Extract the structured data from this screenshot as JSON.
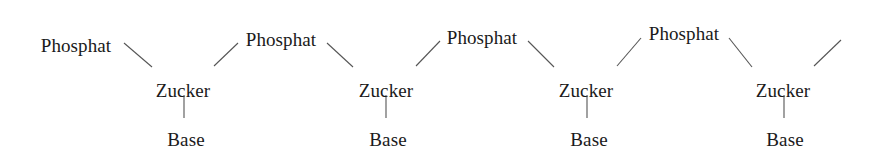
{
  "diagram": {
    "type": "chain-schematic",
    "background_color": "#ffffff",
    "text_color": "#1a1a1a",
    "bond_color": "#555555",
    "bond_width": 1.1,
    "font_size_px": 19,
    "canvas": {
      "width": 872,
      "height": 149
    },
    "labels": {
      "phosphate": "Phosphat",
      "sugar": "Zucker",
      "base": "Base"
    },
    "nodes": [
      {
        "id": "phosphat-1",
        "kind": "phosphate",
        "text": "Phosphat",
        "cx": 76,
        "cy": 36
      },
      {
        "id": "zucker-1",
        "kind": "sugar",
        "text": "Zucker",
        "cx": 183,
        "cy": 81
      },
      {
        "id": "base-1",
        "kind": "base",
        "text": "Base",
        "cx": 186,
        "cy": 130
      },
      {
        "id": "phosphat-2",
        "kind": "phosphate",
        "text": "Phosphat",
        "cx": 281,
        "cy": 30
      },
      {
        "id": "zucker-2",
        "kind": "sugar",
        "text": "Zucker",
        "cx": 386,
        "cy": 81
      },
      {
        "id": "base-2",
        "kind": "base",
        "text": "Base",
        "cx": 388,
        "cy": 130
      },
      {
        "id": "phosphat-3",
        "kind": "phosphate",
        "text": "Phosphat",
        "cx": 482,
        "cy": 28
      },
      {
        "id": "zucker-3",
        "kind": "sugar",
        "text": "Zucker",
        "cx": 586,
        "cy": 81
      },
      {
        "id": "base-3",
        "kind": "base",
        "text": "Base",
        "cx": 589,
        "cy": 130
      },
      {
        "id": "phosphat-4",
        "kind": "phosphate",
        "text": "Phosphat",
        "cx": 684,
        "cy": 24
      },
      {
        "id": "zucker-4",
        "kind": "sugar",
        "text": "Zucker",
        "cx": 783,
        "cy": 81
      },
      {
        "id": "base-4",
        "kind": "base",
        "text": "Base",
        "cx": 785,
        "cy": 130
      }
    ],
    "bonds": [
      {
        "id": "bond-p1-z1",
        "from": "phosphat-1",
        "to": "zucker-1",
        "x1": 124,
        "y1": 43,
        "x2": 152,
        "y2": 67
      },
      {
        "id": "bond-z1-b1",
        "from": "zucker-1",
        "to": "base-1",
        "x1": 184,
        "y1": 95,
        "x2": 184,
        "y2": 118
      },
      {
        "id": "bond-z1-p2",
        "from": "zucker-1",
        "to": "phosphat-2",
        "x1": 214,
        "y1": 66,
        "x2": 238,
        "y2": 43
      },
      {
        "id": "bond-p2-z2",
        "from": "phosphat-2",
        "to": "zucker-2",
        "x1": 327,
        "y1": 43,
        "x2": 353,
        "y2": 67
      },
      {
        "id": "bond-z2-b2",
        "from": "zucker-2",
        "to": "base-2",
        "x1": 386,
        "y1": 95,
        "x2": 386,
        "y2": 118
      },
      {
        "id": "bond-z2-p3",
        "from": "zucker-2",
        "to": "phosphat-3",
        "x1": 416,
        "y1": 66,
        "x2": 440,
        "y2": 41
      },
      {
        "id": "bond-p3-z3",
        "from": "phosphat-3",
        "to": "zucker-3",
        "x1": 528,
        "y1": 41,
        "x2": 554,
        "y2": 67
      },
      {
        "id": "bond-z3-b3",
        "from": "zucker-3",
        "to": "base-3",
        "x1": 587,
        "y1": 95,
        "x2": 587,
        "y2": 118
      },
      {
        "id": "bond-z3-p4",
        "from": "zucker-3",
        "to": "phosphat-4",
        "x1": 617,
        "y1": 66,
        "x2": 641,
        "y2": 38
      },
      {
        "id": "bond-p4-z4",
        "from": "phosphat-4",
        "to": "zucker-4",
        "x1": 729,
        "y1": 38,
        "x2": 752,
        "y2": 67
      },
      {
        "id": "bond-z4-b4",
        "from": "zucker-4",
        "to": "base-4",
        "x1": 784,
        "y1": 95,
        "x2": 784,
        "y2": 118
      },
      {
        "id": "bond-z4-open",
        "from": "zucker-4",
        "to": "chain-continuation",
        "x1": 814,
        "y1": 66,
        "x2": 841,
        "y2": 40
      }
    ]
  }
}
